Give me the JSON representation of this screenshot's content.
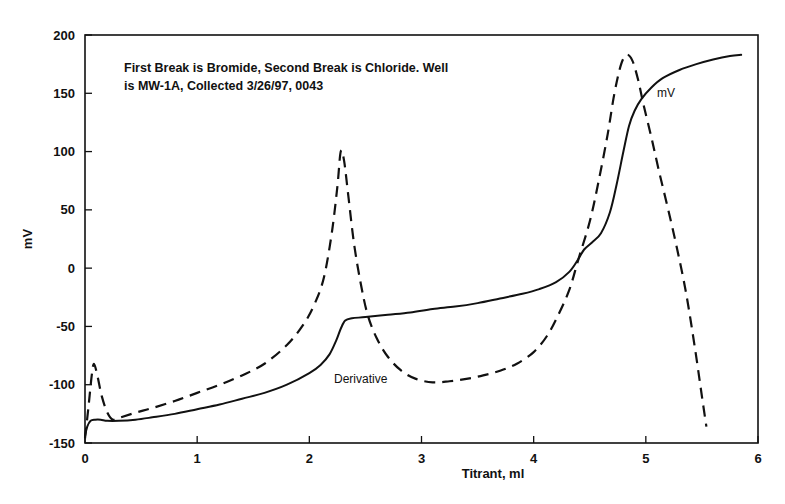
{
  "chart_data": {
    "type": "line",
    "title": "",
    "xlabel": "Titrant, ml",
    "ylabel": "mV",
    "xlim": [
      0,
      6
    ],
    "ylim": [
      -150,
      200
    ],
    "xticks": [
      "0",
      "1",
      "2",
      "3",
      "4",
      "5",
      "6"
    ],
    "yticks": [
      "200",
      "150",
      "100",
      "50",
      "0",
      "-50",
      "-100",
      "-150"
    ],
    "grid": false,
    "legend_position": "inline-annotations",
    "annotations": [
      {
        "name": "description",
        "line1": "First Break is Bromide, Second Break is Chloride.  Well",
        "line2": "is MW-1A, Collected 3/26/97, 0043"
      },
      {
        "name": "mv-series-label",
        "text": "mV"
      },
      {
        "name": "derivative-series-label",
        "text": "Derivative"
      }
    ],
    "series": [
      {
        "name": "mV",
        "style": "solid",
        "color": "#111111",
        "points": [
          [
            0.0,
            -144
          ],
          [
            0.02,
            -136
          ],
          [
            0.05,
            -131
          ],
          [
            0.09,
            -130
          ],
          [
            0.14,
            -130
          ],
          [
            0.2,
            -131
          ],
          [
            0.3,
            -131
          ],
          [
            0.45,
            -130
          ],
          [
            0.6,
            -128
          ],
          [
            0.8,
            -125
          ],
          [
            1.0,
            -121
          ],
          [
            1.2,
            -117
          ],
          [
            1.4,
            -112
          ],
          [
            1.6,
            -107
          ],
          [
            1.8,
            -100
          ],
          [
            2.0,
            -90
          ],
          [
            2.1,
            -83
          ],
          [
            2.18,
            -74
          ],
          [
            2.24,
            -62
          ],
          [
            2.28,
            -52
          ],
          [
            2.32,
            -45
          ],
          [
            2.38,
            -43
          ],
          [
            2.5,
            -42
          ],
          [
            2.7,
            -40
          ],
          [
            2.9,
            -38
          ],
          [
            3.1,
            -35
          ],
          [
            3.3,
            -33
          ],
          [
            3.5,
            -30
          ],
          [
            3.7,
            -26
          ],
          [
            3.9,
            -22
          ],
          [
            4.05,
            -18
          ],
          [
            4.2,
            -12
          ],
          [
            4.32,
            -3
          ],
          [
            4.4,
            8
          ],
          [
            4.45,
            16
          ],
          [
            4.52,
            22
          ],
          [
            4.6,
            30
          ],
          [
            4.68,
            48
          ],
          [
            4.74,
            72
          ],
          [
            4.8,
            100
          ],
          [
            4.85,
            122
          ],
          [
            4.9,
            135
          ],
          [
            4.96,
            145
          ],
          [
            5.05,
            155
          ],
          [
            5.15,
            163
          ],
          [
            5.3,
            170
          ],
          [
            5.45,
            175
          ],
          [
            5.6,
            179
          ],
          [
            5.75,
            182
          ],
          [
            5.85,
            183
          ]
        ]
      },
      {
        "name": "Derivative",
        "style": "dashed",
        "color": "#111111",
        "points": [
          [
            0.0,
            -146
          ],
          [
            0.03,
            -120
          ],
          [
            0.06,
            -92
          ],
          [
            0.08,
            -82
          ],
          [
            0.11,
            -92
          ],
          [
            0.15,
            -110
          ],
          [
            0.2,
            -124
          ],
          [
            0.25,
            -130
          ],
          [
            0.32,
            -128
          ],
          [
            0.45,
            -124
          ],
          [
            0.6,
            -120
          ],
          [
            0.8,
            -114
          ],
          [
            1.0,
            -107
          ],
          [
            1.2,
            -100
          ],
          [
            1.4,
            -92
          ],
          [
            1.6,
            -82
          ],
          [
            1.8,
            -66
          ],
          [
            1.95,
            -48
          ],
          [
            2.05,
            -30
          ],
          [
            2.13,
            -8
          ],
          [
            2.2,
            30
          ],
          [
            2.25,
            70
          ],
          [
            2.28,
            100
          ],
          [
            2.31,
            92
          ],
          [
            2.35,
            60
          ],
          [
            2.4,
            20
          ],
          [
            2.46,
            -14
          ],
          [
            2.52,
            -40
          ],
          [
            2.6,
            -60
          ],
          [
            2.7,
            -76
          ],
          [
            2.82,
            -88
          ],
          [
            2.95,
            -95
          ],
          [
            3.1,
            -98
          ],
          [
            3.25,
            -97
          ],
          [
            3.4,
            -95
          ],
          [
            3.55,
            -92
          ],
          [
            3.7,
            -88
          ],
          [
            3.85,
            -82
          ],
          [
            4.0,
            -72
          ],
          [
            4.12,
            -58
          ],
          [
            4.22,
            -40
          ],
          [
            4.32,
            -18
          ],
          [
            4.4,
            8
          ],
          [
            4.5,
            40
          ],
          [
            4.58,
            75
          ],
          [
            4.66,
            115
          ],
          [
            4.72,
            150
          ],
          [
            4.78,
            175
          ],
          [
            4.83,
            183
          ],
          [
            4.88,
            178
          ],
          [
            4.93,
            162
          ],
          [
            4.98,
            140
          ],
          [
            5.05,
            112
          ],
          [
            5.12,
            82
          ],
          [
            5.2,
            50
          ],
          [
            5.28,
            16
          ],
          [
            5.36,
            -22
          ],
          [
            5.44,
            -70
          ],
          [
            5.5,
            -110
          ],
          [
            5.54,
            -136
          ]
        ]
      }
    ]
  }
}
